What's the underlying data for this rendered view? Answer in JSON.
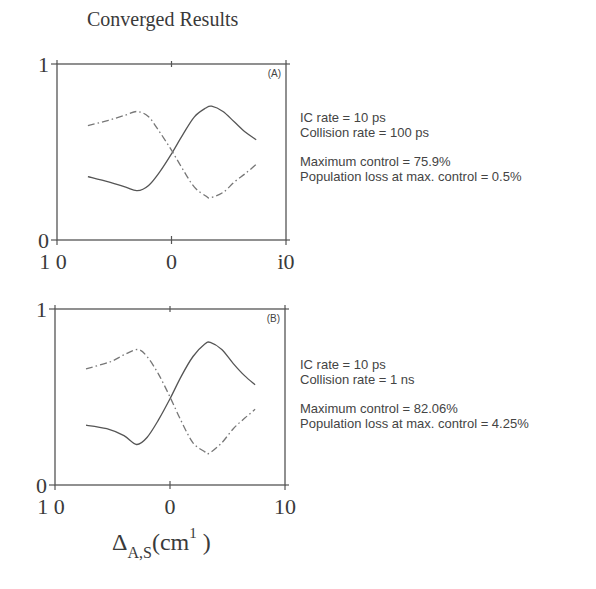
{
  "title": "Converged Results",
  "xlabel": {
    "symbol": "Δ",
    "subscript": "A,S",
    "unit_open": "(cm",
    "unit_exp": "1",
    "unit_close": " )"
  },
  "panels": [
    {
      "tag": "(A)",
      "y_ticks": [
        "1",
        "0"
      ],
      "x_ticks": [
        "1 0",
        "0",
        "i0"
      ],
      "annotations": {
        "ic_rate": "IC rate = 10 ps",
        "collision_rate": "Collision rate = 100 ps",
        "max_control": "Maximum control = 75.9%",
        "pop_loss": "Population loss at max. control = 0.5%"
      }
    },
    {
      "tag": "(B)",
      "y_ticks": [
        "1",
        "0"
      ],
      "x_ticks": [
        "1 0",
        "0",
        "10"
      ],
      "annotations": {
        "ic_rate": "IC rate = 10 ps",
        "collision_rate": "Collision rate = 1 ns",
        "max_control": "Maximum control = 82.06%",
        "pop_loss": "Population loss at max. control = 4.25%"
      }
    }
  ],
  "colors": {
    "axes": "#555555",
    "solid_line": "#555555",
    "dashdot_line": "#777777"
  },
  "chart_data": [
    {
      "type": "line",
      "title": "Converged Results",
      "panel": "(A)",
      "xlabel": "ΔA,S (cm-1)",
      "ylabel": "",
      "xlim": [
        -10,
        10
      ],
      "ylim": [
        0,
        1
      ],
      "grid": false,
      "series": [
        {
          "name": "solid",
          "style": "solid",
          "x": [
            -7.3,
            -5.5,
            -4.0,
            -3.0,
            -2.0,
            -1.0,
            0.0,
            1.0,
            2.0,
            3.0,
            3.5,
            4.5,
            5.5,
            6.5,
            7.4
          ],
          "y": [
            0.36,
            0.33,
            0.3,
            0.28,
            0.31,
            0.39,
            0.49,
            0.6,
            0.7,
            0.75,
            0.76,
            0.73,
            0.67,
            0.61,
            0.57
          ]
        },
        {
          "name": "dash-dot",
          "style": "dashdot",
          "x": [
            -7.3,
            -5.5,
            -4.0,
            -3.0,
            -2.0,
            -1.0,
            0.0,
            1.0,
            2.0,
            3.0,
            3.4,
            4.5,
            5.5,
            6.5,
            7.4
          ],
          "y": [
            0.65,
            0.68,
            0.71,
            0.73,
            0.7,
            0.61,
            0.51,
            0.4,
            0.3,
            0.25,
            0.24,
            0.27,
            0.33,
            0.38,
            0.43
          ]
        }
      ],
      "annotations": [
        "IC rate = 10 ps",
        "Collision rate = 100 ps",
        "Maximum control = 75.9%",
        "Population loss at max. control = 0.5%"
      ]
    },
    {
      "type": "line",
      "panel": "(B)",
      "xlabel": "ΔA,S (cm-1)",
      "ylabel": "",
      "xlim": [
        -10,
        10
      ],
      "ylim": [
        0,
        1
      ],
      "grid": false,
      "series": [
        {
          "name": "solid",
          "style": "solid",
          "x": [
            -7.3,
            -5.5,
            -4.0,
            -2.9,
            -2.0,
            -1.0,
            0.0,
            1.0,
            2.0,
            3.0,
            3.5,
            4.5,
            5.5,
            6.5,
            7.4
          ],
          "y": [
            0.34,
            0.32,
            0.28,
            0.23,
            0.27,
            0.37,
            0.49,
            0.62,
            0.73,
            0.8,
            0.81,
            0.77,
            0.69,
            0.62,
            0.57
          ]
        },
        {
          "name": "dash-dot",
          "style": "dashdot",
          "x": [
            -7.3,
            -5.2,
            -4.0,
            -2.8,
            -2.0,
            -1.0,
            0.0,
            1.0,
            2.0,
            3.0,
            3.4,
            4.5,
            5.5,
            6.5,
            7.4
          ],
          "y": [
            0.66,
            0.7,
            0.74,
            0.77,
            0.73,
            0.63,
            0.5,
            0.36,
            0.24,
            0.19,
            0.18,
            0.24,
            0.32,
            0.38,
            0.43
          ]
        }
      ],
      "annotations": [
        "IC rate = 10 ps",
        "Collision rate = 1 ns",
        "Maximum control = 82.06%",
        "Population loss at max. control = 4.25%"
      ]
    }
  ]
}
